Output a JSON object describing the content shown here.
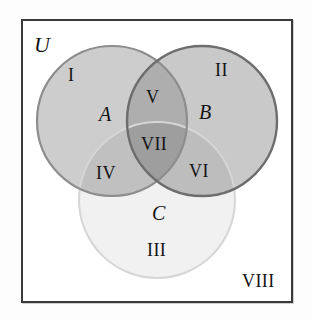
{
  "diagram": {
    "kind": "venn-diagram",
    "title_label": "U",
    "universe": {
      "name": "universe-set",
      "label": "U",
      "description": "rectangular universal set frame"
    },
    "sets": [
      {
        "id": "A",
        "label": "A",
        "name": "set-a-circle",
        "fill": "#c9c9c9",
        "stroke": "#8a8a8a",
        "position": "left"
      },
      {
        "id": "B",
        "label": "B",
        "name": "set-b-circle",
        "fill": "#c4c4c4",
        "stroke": "#6f6f6f",
        "position": "right"
      },
      {
        "id": "C",
        "label": "C",
        "name": "set-c-circle",
        "fill": "#f0f0f0",
        "stroke": "#d2d2d2",
        "position": "bottom"
      }
    ],
    "regions": [
      {
        "numeral": "I",
        "name": "region-i",
        "meaning": "A only"
      },
      {
        "numeral": "II",
        "name": "region-ii",
        "meaning": "B only"
      },
      {
        "numeral": "III",
        "name": "region-iii",
        "meaning": "C only"
      },
      {
        "numeral": "IV",
        "name": "region-iv",
        "meaning": "A and C only"
      },
      {
        "numeral": "V",
        "name": "region-v",
        "meaning": "A and B only"
      },
      {
        "numeral": "VI",
        "name": "region-vi",
        "meaning": "B and C only"
      },
      {
        "numeral": "VII",
        "name": "region-vii",
        "meaning": "A and B and C"
      },
      {
        "numeral": "VIII",
        "name": "region-viii",
        "meaning": "outside all sets"
      }
    ],
    "colors": {
      "frame_border": "#3a3a3a",
      "canvas": "#ffffff",
      "text": "#141414",
      "set_a_fill": "#c9c9c9",
      "set_b_fill": "#c4c4c4",
      "set_c_fill": "#f0f0f0",
      "overlap_ab": "#a9a9a9",
      "overlap_abc": "#9a9a9a"
    }
  }
}
